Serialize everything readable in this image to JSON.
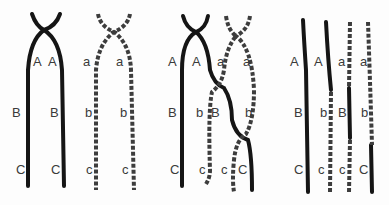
{
  "figure": {
    "panels": [
      {
        "id": "panel-1",
        "labels": [
          {
            "t": "A",
            "x": 33,
            "y": 55
          },
          {
            "t": "A",
            "x": 48,
            "y": 55
          },
          {
            "t": "B",
            "x": 12,
            "y": 106
          },
          {
            "t": "B",
            "x": 50,
            "y": 106
          },
          {
            "t": "C",
            "x": 16,
            "y": 163
          },
          {
            "t": "C",
            "x": 51,
            "y": 163
          },
          {
            "t": "a",
            "x": 83,
            "y": 55
          },
          {
            "t": "a",
            "x": 116,
            "y": 55
          },
          {
            "t": "b",
            "x": 85,
            "y": 106
          },
          {
            "t": "b",
            "x": 120,
            "y": 106
          },
          {
            "t": "c",
            "x": 86,
            "y": 163
          },
          {
            "t": "c",
            "x": 122,
            "y": 163
          }
        ]
      },
      {
        "id": "panel-2",
        "labels": [
          {
            "t": "A",
            "x": 168,
            "y": 55
          },
          {
            "t": "A",
            "x": 192,
            "y": 55
          },
          {
            "t": "a",
            "x": 217,
            "y": 55
          },
          {
            "t": "a",
            "x": 243,
            "y": 55
          },
          {
            "t": "B",
            "x": 168,
            "y": 106
          },
          {
            "t": "b",
            "x": 196,
            "y": 106
          },
          {
            "t": "B",
            "x": 211,
            "y": 106
          },
          {
            "t": "b",
            "x": 245,
            "y": 106
          },
          {
            "t": "C",
            "x": 170,
            "y": 163
          },
          {
            "t": "c",
            "x": 199,
            "y": 163
          },
          {
            "t": "c",
            "x": 221,
            "y": 163
          },
          {
            "t": "C",
            "x": 238,
            "y": 163
          }
        ]
      },
      {
        "id": "panel-3",
        "labels": [
          {
            "t": "A",
            "x": 290,
            "y": 55
          },
          {
            "t": "A",
            "x": 314,
            "y": 55
          },
          {
            "t": "a",
            "x": 338,
            "y": 55
          },
          {
            "t": "a",
            "x": 360,
            "y": 55
          },
          {
            "t": "B",
            "x": 294,
            "y": 106
          },
          {
            "t": "b",
            "x": 320,
            "y": 106
          },
          {
            "t": "B",
            "x": 338,
            "y": 106
          },
          {
            "t": "b",
            "x": 361,
            "y": 106
          },
          {
            "t": "C",
            "x": 294,
            "y": 163
          },
          {
            "t": "c",
            "x": 318,
            "y": 163
          },
          {
            "t": "c",
            "x": 339,
            "y": 163
          },
          {
            "t": "C",
            "x": 359,
            "y": 163
          }
        ]
      }
    ]
  }
}
